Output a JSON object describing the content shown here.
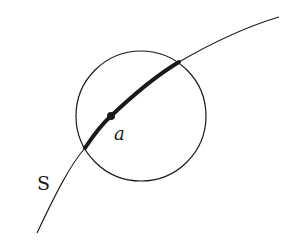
{
  "diagram": {
    "curve_label": "S",
    "point_label": "a",
    "colors": {
      "stroke": "#1a1a1a",
      "background": "#ffffff"
    },
    "elements": {
      "curve": "thin curve S passing through the neighborhood",
      "circle": "open ball neighborhood around point a",
      "highlighted_arc": "portion of S inside the ball (bold)",
      "point": "point a on S"
    }
  }
}
